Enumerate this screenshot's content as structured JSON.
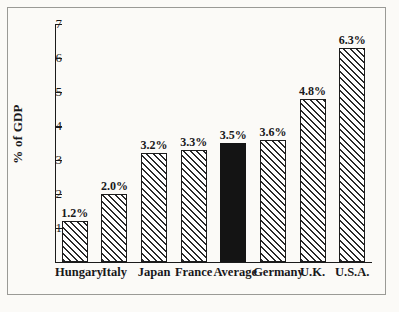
{
  "chart_data": {
    "type": "bar",
    "title": "",
    "xlabel": "",
    "ylabel": "% of GDP",
    "categories": [
      "Hungary",
      "Italy",
      "Japan",
      "France",
      "Average",
      "Germany",
      "U.K.",
      "U.S.A."
    ],
    "values": [
      1.2,
      2.0,
      3.2,
      3.3,
      3.5,
      3.6,
      4.8,
      6.3
    ],
    "value_labels": [
      "1.2%",
      "2.0%",
      "3.2%",
      "3.3%",
      "3.5%",
      "3.6%",
      "4.8%",
      "6.3%"
    ],
    "ylim": [
      0,
      7
    ],
    "yticks": [
      1,
      2,
      3,
      4,
      5,
      6,
      7
    ],
    "ytick_labels": [
      "1",
      "2",
      "3",
      "4",
      "5",
      "6",
      "7"
    ],
    "grid": false,
    "legend": "none",
    "bar_styles": [
      "hatched",
      "hatched",
      "hatched",
      "hatched",
      "solid",
      "hatched",
      "hatched",
      "hatched"
    ],
    "highlight_category": "Average",
    "colors": {
      "bar_fill": "#ffffff",
      "bar_hatch": "#2a2a2a",
      "bar_outline": "#1b1b1b",
      "highlight_fill": "#141414",
      "axis": "#1b1b1b",
      "text": "#18181a",
      "background": "#fbfaf7",
      "frame": "#9a9a96"
    }
  }
}
